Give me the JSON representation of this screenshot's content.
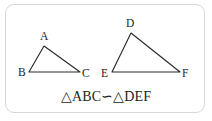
{
  "figure": {
    "kind": "geometry-diagram",
    "background_color": "#ffffff",
    "card": {
      "border_color": "#d8d8d8",
      "fill_color": "#ffffff",
      "corner_radius": "9px"
    },
    "stroke_color": "#2b2b2b",
    "text_color": "#1d1d1d"
  },
  "triangles": [
    {
      "name": "triangle-abc",
      "vertices": [
        {
          "label": "A",
          "x": 44,
          "y": 46,
          "label_x": 40,
          "label_y": 40
        },
        {
          "label": "B",
          "x": 29,
          "y": 72,
          "label_x": 18,
          "label_y": 76
        },
        {
          "label": "C",
          "x": 80,
          "y": 72,
          "label_x": 82,
          "label_y": 77
        }
      ]
    },
    {
      "name": "triangle-def",
      "vertices": [
        {
          "label": "D",
          "x": 131,
          "y": 33,
          "label_x": 126,
          "label_y": 27
        },
        {
          "label": "E",
          "x": 112,
          "y": 72,
          "label_x": 101,
          "label_y": 77
        },
        {
          "label": "F",
          "x": 180,
          "y": 72,
          "label_x": 182,
          "label_y": 77
        }
      ]
    }
  ],
  "caption": {
    "text": "△ABC∽△DEF",
    "x": 106,
    "y": 101,
    "meaning": "triangle ABC is similar to triangle DEF"
  }
}
